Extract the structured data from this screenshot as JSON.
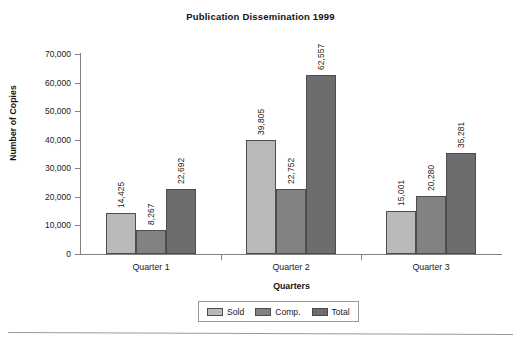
{
  "chart_data": {
    "type": "bar",
    "title": "Publication Dissemination 1999",
    "xlabel": "Quarters",
    "ylabel": "Number of Copies",
    "categories": [
      "Quarter 1",
      "Quarter 2",
      "Quarter 3"
    ],
    "series": [
      {
        "name": "Sold",
        "color": "#b9b9b9",
        "values": [
          14425,
          39805,
          15001
        ],
        "labels": [
          "14,425",
          "39,805",
          "15,001"
        ]
      },
      {
        "name": "Comp.",
        "color": "#828282",
        "values": [
          8267,
          22752,
          20280
        ],
        "labels": [
          "8,267",
          "22,752",
          "20,280"
        ]
      },
      {
        "name": "Total",
        "color": "#6d6d6d",
        "values": [
          22692,
          62557,
          35281
        ],
        "labels": [
          "22,692",
          "62,557",
          "35,281"
        ]
      }
    ],
    "ylim": [
      0,
      70000
    ],
    "y_tick_values": [
      0,
      10000,
      20000,
      30000,
      40000,
      50000,
      60000,
      70000
    ],
    "y_tick_labels": [
      "0",
      "10,000",
      "20,000",
      "30,000",
      "40,000",
      "50,000",
      "60,000",
      "70,000"
    ],
    "grid": false,
    "legend_position": "bottom",
    "value_labels_rotated": true
  },
  "legend": {
    "entries": [
      {
        "label": "Sold"
      },
      {
        "label": "Comp."
      },
      {
        "label": "Total"
      }
    ]
  }
}
